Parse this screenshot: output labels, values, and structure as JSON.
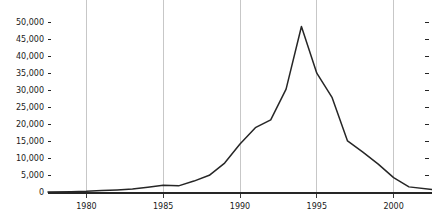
{
  "chart_data": {
    "type": "line",
    "title": "",
    "subtitle": "",
    "xlabel": "",
    "ylabel": "",
    "grid": true,
    "legend": null,
    "legend_position": "none",
    "xlim": [
      1977.5,
      2002.5
    ],
    "ylim": [
      0,
      52000
    ],
    "xticks": [
      1980,
      1985,
      1990,
      1995,
      2000
    ],
    "xtick_labels": [
      "1980",
      "1985",
      "1990",
      "1995",
      "2000"
    ],
    "yticks": [
      0,
      5000,
      10000,
      15000,
      20000,
      25000,
      30000,
      35000,
      40000,
      45000,
      50000
    ],
    "ytick_labels": [
      "0",
      "5,000",
      "10,000",
      "15,000",
      "20,000",
      "25,000",
      "30,000",
      "35,000",
      "40,000",
      "45,000",
      "50,000"
    ],
    "line_color": "#262626",
    "series": [
      {
        "name": "series-1",
        "x": [
          1977.5,
          1979,
          1980,
          1981,
          1982,
          1983,
          1984,
          1985,
          1986,
          1987,
          1988,
          1989,
          1990,
          1991,
          1992,
          1993,
          1994,
          1995,
          1996,
          1997,
          1998,
          1999,
          2000,
          2001,
          2002.5
        ],
        "values": [
          300,
          400,
          500,
          700,
          900,
          1200,
          1700,
          2300,
          2100,
          3500,
          5200,
          8800,
          14400,
          19200,
          21500,
          30500,
          48900,
          35200,
          28000,
          15300,
          12000,
          8500,
          4500,
          1800,
          1000
        ]
      }
    ]
  },
  "axes": {
    "y_axis_name": "y-axis",
    "x_axis_name": "x-axis",
    "baseline_name": "x-axis-baseline"
  }
}
